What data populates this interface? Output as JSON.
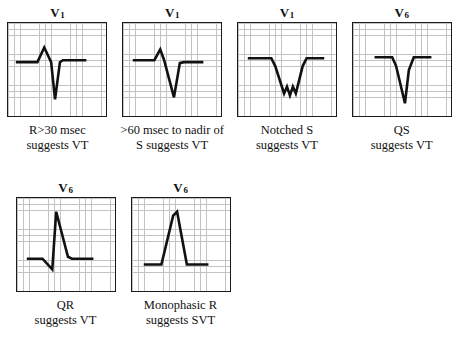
{
  "figure": {
    "background_color": "#ffffff",
    "trace_color": "#111111",
    "grid_color": "#b9b9b9",
    "border_color": "#1b1b1b"
  },
  "panels": [
    {
      "lead": "V",
      "lead_subscript": "1",
      "caption_line1": "R>30 msec",
      "caption_line2": "suggests VT",
      "waveform_name": "r-wave-greater-30-msec",
      "path": "M8,40 L30,40 L37,25 L44,40 L48,78 L53,40 L56,38 L80,38"
    },
    {
      "lead": "V",
      "lead_subscript": "1",
      "caption_line1": ">60 msec to nadir of",
      "caption_line2": "S suggests VT",
      "waveform_name": "nadir-60-msec",
      "path": "M10,38 L32,38 L38,27 L42,38 L52,76 L58,41 L62,40 L82,40"
    },
    {
      "lead": "V",
      "lead_subscript": "1",
      "caption_line1": "Notched S",
      "caption_line2": "suggests VT",
      "waveform_name": "notched-s-wave",
      "path": "M10,36 L34,36 L38,44 L47,72 L50,65 L53,74 L56,65 L59,72 L66,44 L70,36 L88,36"
    },
    {
      "lead": "V",
      "lead_subscript": "6",
      "caption_line1": "QS",
      "caption_line2": "suggests VT",
      "waveform_name": "qs-complex",
      "path": "M22,35 L40,35 L44,44 L53,82 L57,48 L62,35 L80,35"
    },
    {
      "lead": "V",
      "lead_subscript": "6",
      "caption_line1": "QR",
      "caption_line2": "suggests VT",
      "waveform_name": "qr-complex",
      "path": "M10,62 L26,62 L36,73 L40,14 L52,60 L56,62 L78,62"
    },
    {
      "lead": "V",
      "lead_subscript": "6",
      "caption_line1": "Monophasic R",
      "caption_line2": "suggests SVT",
      "waveform_name": "monophasic-r-wave",
      "path": "M12,68 L30,68 L42,18 L46,14 L56,68 L78,68"
    }
  ]
}
